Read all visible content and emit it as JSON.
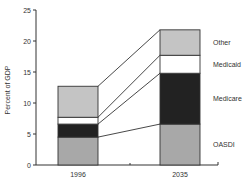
{
  "chart_data": {
    "type": "bar",
    "stacked": true,
    "title": "",
    "xlabel": "",
    "ylabel": "Percent of GDP",
    "ylim": [
      0,
      25
    ],
    "yticks": [
      0,
      5,
      10,
      15,
      20,
      25
    ],
    "categories": [
      "1996",
      "2035"
    ],
    "series": [
      {
        "name": "OASDI",
        "values": [
          4.5,
          6.6
        ],
        "color": "#a8a8a8"
      },
      {
        "name": "Medicare",
        "values": [
          2.1,
          8.2
        ],
        "color": "#222222"
      },
      {
        "name": "Medicaid",
        "values": [
          1.1,
          2.9
        ],
        "color": "#ffffff"
      },
      {
        "name": "Other",
        "values": [
          5.0,
          4.1
        ],
        "color": "#c4c4c4"
      }
    ],
    "totals": [
      12.7,
      21.8
    ],
    "grid": false,
    "legend_position": "right, inline labels next to 2035 bar",
    "connector_lines": true
  }
}
